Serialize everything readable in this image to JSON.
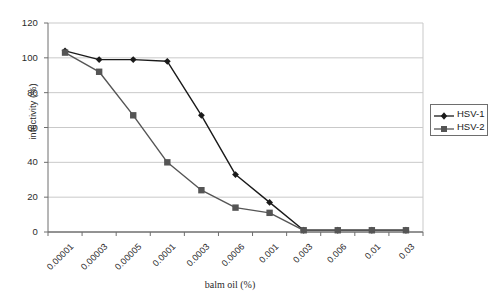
{
  "chart_data": {
    "type": "line",
    "title": "",
    "xlabel": "balm oil (%)",
    "ylabel": "infectivity (%)",
    "categories": [
      "0.00001",
      "0.00003",
      "0.00005",
      "0.0001",
      "0.0003",
      "0.0006",
      "0.001",
      "0.003",
      "0.006",
      "0.01",
      "0.03"
    ],
    "ylim": [
      0,
      120
    ],
    "yticks": [
      0,
      20,
      40,
      60,
      80,
      100,
      120
    ],
    "grid": "horizontal",
    "legend_position": "right-outside",
    "series": [
      {
        "name": "HSV-1",
        "marker": "diamond",
        "color": "#1a1a1a",
        "values": [
          104,
          99,
          99,
          98,
          67,
          33,
          17,
          1,
          1,
          1,
          1
        ]
      },
      {
        "name": "HSV-2",
        "marker": "square",
        "color": "#555555",
        "values": [
          103,
          92,
          67,
          40,
          24,
          14,
          11,
          1,
          1,
          1,
          1
        ]
      }
    ]
  },
  "legend": {
    "entries": [
      {
        "label": "HSV-1"
      },
      {
        "label": "HSV-2"
      }
    ]
  },
  "axes": {
    "y_tick_labels": [
      "0",
      "20",
      "40",
      "60",
      "80",
      "100",
      "120"
    ],
    "y_title": "infectivity (%)",
    "x_tick_labels": [
      "0.00001",
      "0.00003",
      "0.00005",
      "0.0001",
      "0.0003",
      "0.0006",
      "0.001",
      "0.003",
      "0.006",
      "0.01",
      "0.03"
    ],
    "x_title": "balm oil (%)"
  }
}
